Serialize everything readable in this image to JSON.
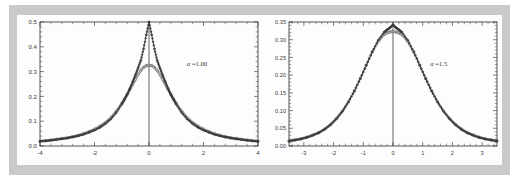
{
  "figure": {
    "title": "",
    "frame_color": "#c9c9c9",
    "panel_color": "#fdfdfd",
    "axis_color": "#2b2b2b",
    "curve_color": "#2e2e2e",
    "marker_color": "#4a4a4a"
  },
  "chart_data": [
    {
      "type": "line",
      "title": "",
      "subtitle": "",
      "xlabel": "",
      "ylabel": "",
      "annotation": "α =1.00",
      "annotation_symbol": "α",
      "annotation_value": "1.00",
      "xlim": [
        -4,
        4
      ],
      "ylim": [
        0.0,
        0.5
      ],
      "xticks": [
        -4,
        -2,
        0,
        2,
        4
      ],
      "xticklabels": [
        "-4",
        "-2",
        "0",
        "2",
        "4"
      ],
      "yticks": [
        0.0,
        0.1,
        0.2,
        0.3,
        0.4,
        0.5
      ],
      "yticklabels": [
        "0.0",
        "0.1",
        "0.2",
        "0.3",
        "0.4",
        "0.5"
      ],
      "grid": false,
      "legend": "none",
      "vertical_rule_at_x": 0,
      "series": [
        {
          "name": "peaked-density",
          "marker": "circle-filled",
          "x": [
            -4.0,
            -3.8,
            -3.6,
            -3.4,
            -3.2,
            -3.0,
            -2.8,
            -2.6,
            -2.4,
            -2.2,
            -2.0,
            -1.8,
            -1.6,
            -1.4,
            -1.2,
            -1.0,
            -0.9,
            -0.8,
            -0.7,
            -0.6,
            -0.5,
            -0.4,
            -0.3,
            -0.2,
            -0.1,
            0.0,
            0.1,
            0.2,
            0.3,
            0.4,
            0.5,
            0.6,
            0.7,
            0.8,
            0.9,
            1.0,
            1.2,
            1.4,
            1.6,
            1.8,
            2.0,
            2.2,
            2.4,
            2.6,
            2.8,
            3.0,
            3.2,
            3.4,
            3.6,
            3.8,
            4.0
          ],
          "y": [
            0.019,
            0.021,
            0.023,
            0.026,
            0.029,
            0.032,
            0.036,
            0.041,
            0.047,
            0.055,
            0.064,
            0.075,
            0.09,
            0.109,
            0.135,
            0.168,
            0.187,
            0.208,
            0.232,
            0.258,
            0.286,
            0.315,
            0.345,
            0.392,
            0.448,
            0.5,
            0.448,
            0.392,
            0.345,
            0.315,
            0.286,
            0.258,
            0.232,
            0.208,
            0.187,
            0.168,
            0.135,
            0.109,
            0.09,
            0.075,
            0.064,
            0.055,
            0.047,
            0.041,
            0.036,
            0.032,
            0.029,
            0.026,
            0.023,
            0.021,
            0.019
          ]
        },
        {
          "name": "smooth-density",
          "marker": "circle-open",
          "x": [
            -4.0,
            -3.8,
            -3.6,
            -3.4,
            -3.2,
            -3.0,
            -2.8,
            -2.6,
            -2.4,
            -2.2,
            -2.0,
            -1.8,
            -1.6,
            -1.4,
            -1.2,
            -1.0,
            -0.9,
            -0.8,
            -0.7,
            -0.6,
            -0.5,
            -0.4,
            -0.3,
            -0.2,
            -0.1,
            0.0,
            0.1,
            0.2,
            0.3,
            0.4,
            0.5,
            0.6,
            0.7,
            0.8,
            0.9,
            1.0,
            1.2,
            1.4,
            1.6,
            1.8,
            2.0,
            2.2,
            2.4,
            2.6,
            2.8,
            3.0,
            3.2,
            3.4,
            3.6,
            3.8,
            4.0
          ],
          "y": [
            0.019,
            0.021,
            0.024,
            0.027,
            0.03,
            0.033,
            0.038,
            0.043,
            0.05,
            0.058,
            0.068,
            0.08,
            0.095,
            0.115,
            0.141,
            0.172,
            0.19,
            0.208,
            0.228,
            0.248,
            0.268,
            0.288,
            0.305,
            0.317,
            0.324,
            0.326,
            0.324,
            0.317,
            0.305,
            0.288,
            0.268,
            0.248,
            0.228,
            0.208,
            0.19,
            0.172,
            0.141,
            0.115,
            0.095,
            0.08,
            0.068,
            0.058,
            0.05,
            0.043,
            0.038,
            0.033,
            0.03,
            0.027,
            0.024,
            0.021,
            0.019
          ]
        }
      ]
    },
    {
      "type": "line",
      "title": "",
      "subtitle": "",
      "xlabel": "",
      "ylabel": "",
      "annotation": "α =1.5",
      "annotation_symbol": "α",
      "annotation_value": "1.5",
      "xlim": [
        -3.5,
        3.5
      ],
      "ylim": [
        0.0,
        0.35
      ],
      "xticks": [
        -3,
        -2,
        -1,
        0,
        1,
        2,
        3
      ],
      "xticklabels": [
        "-3",
        "-2",
        "-1",
        "0",
        "1",
        "2",
        "3"
      ],
      "yticks": [
        0.0,
        0.05,
        0.1,
        0.15,
        0.2,
        0.25,
        0.3,
        0.35
      ],
      "yticklabels": [
        "0.00",
        "0.05",
        "0.10",
        "0.15",
        "0.20",
        "0.25",
        "0.30",
        "0.35"
      ],
      "grid": false,
      "legend": "none",
      "vertical_rule_at_x": 0,
      "series": [
        {
          "name": "peaked-density",
          "marker": "circle-filled",
          "x": [
            -3.5,
            -3.3,
            -3.1,
            -2.9,
            -2.7,
            -2.5,
            -2.3,
            -2.1,
            -1.9,
            -1.7,
            -1.5,
            -1.3,
            -1.1,
            -0.9,
            -0.7,
            -0.5,
            -0.3,
            -0.2,
            -0.1,
            0.0,
            0.1,
            0.2,
            0.3,
            0.5,
            0.7,
            0.9,
            1.1,
            1.3,
            1.5,
            1.7,
            1.9,
            2.1,
            2.3,
            2.5,
            2.7,
            2.9,
            3.1,
            3.3,
            3.5
          ],
          "y": [
            0.014,
            0.017,
            0.02,
            0.024,
            0.03,
            0.037,
            0.047,
            0.06,
            0.077,
            0.098,
            0.124,
            0.155,
            0.19,
            0.228,
            0.266,
            0.298,
            0.321,
            0.328,
            0.334,
            0.342,
            0.334,
            0.328,
            0.321,
            0.298,
            0.266,
            0.228,
            0.19,
            0.155,
            0.124,
            0.098,
            0.077,
            0.06,
            0.047,
            0.037,
            0.03,
            0.024,
            0.02,
            0.017,
            0.014
          ]
        },
        {
          "name": "smooth-density",
          "marker": "circle-open",
          "x": [
            -3.5,
            -3.3,
            -3.1,
            -2.9,
            -2.7,
            -2.5,
            -2.3,
            -2.1,
            -1.9,
            -1.7,
            -1.5,
            -1.3,
            -1.1,
            -0.9,
            -0.7,
            -0.5,
            -0.3,
            -0.2,
            -0.1,
            0.0,
            0.1,
            0.2,
            0.3,
            0.5,
            0.7,
            0.9,
            1.1,
            1.3,
            1.5,
            1.7,
            1.9,
            2.1,
            2.3,
            2.5,
            2.7,
            2.9,
            3.1,
            3.3,
            3.5
          ],
          "y": [
            0.014,
            0.017,
            0.02,
            0.025,
            0.031,
            0.038,
            0.048,
            0.061,
            0.078,
            0.099,
            0.125,
            0.156,
            0.191,
            0.228,
            0.264,
            0.294,
            0.314,
            0.319,
            0.322,
            0.323,
            0.322,
            0.319,
            0.314,
            0.294,
            0.264,
            0.228,
            0.191,
            0.156,
            0.125,
            0.099,
            0.078,
            0.061,
            0.048,
            0.038,
            0.031,
            0.025,
            0.02,
            0.017,
            0.014
          ]
        }
      ]
    }
  ]
}
